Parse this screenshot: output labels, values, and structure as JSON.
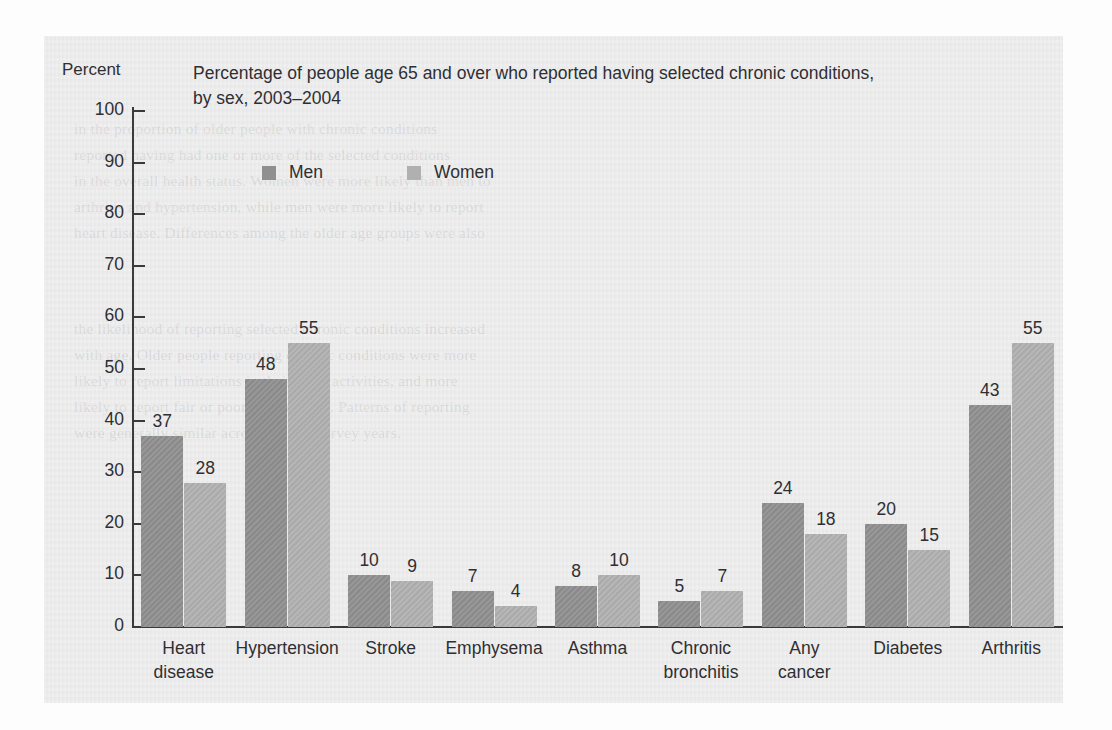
{
  "figure": {
    "background_color": "#fdfdfd",
    "panel_color": "#eeeeee",
    "y_axis_title": "Percent",
    "title_line_1": "Percentage of people age 65 and over who reported having selected chronic conditions,",
    "title_line_2": "by sex, 2003–2004"
  },
  "legend": {
    "items": [
      {
        "label": "Men",
        "color": "#8f8f8f",
        "swatch_name": "legend-swatch-men"
      },
      {
        "label": "Women",
        "color": "#b0b0b0",
        "swatch_name": "legend-swatch-women"
      }
    ]
  },
  "y_axis": {
    "ticks": [
      "100",
      "90",
      "80",
      "70",
      "60",
      "50",
      "40",
      "30",
      "20",
      "10",
      "0"
    ]
  },
  "categories": [
    {
      "line1": "Heart",
      "line2": "disease"
    },
    {
      "line1": "Hypertension",
      "line2": ""
    },
    {
      "line1": "Stroke",
      "line2": ""
    },
    {
      "line1": "Emphysema",
      "line2": ""
    },
    {
      "line1": "Asthma",
      "line2": ""
    },
    {
      "line1": "Chronic",
      "line2": "bronchitis"
    },
    {
      "line1": "Any",
      "line2": "cancer"
    },
    {
      "line1": "Diabetes",
      "line2": ""
    },
    {
      "line1": "Arthritis",
      "line2": ""
    }
  ],
  "values": {
    "men": [
      "37",
      "48",
      "10",
      "7",
      "8",
      "5",
      "24",
      "20",
      "43"
    ],
    "women": [
      "28",
      "55",
      "9",
      "4",
      "10",
      "7",
      "18",
      "15",
      "55"
    ]
  },
  "chart_data": {
    "type": "bar",
    "title": "Percentage of people age 65 and over who reported having selected chronic conditions, by sex, 2003–2004",
    "xlabel": "",
    "ylabel": "Percent",
    "ylim": [
      0,
      100
    ],
    "yticks": [
      0,
      10,
      20,
      30,
      40,
      50,
      60,
      70,
      80,
      90,
      100
    ],
    "grid": false,
    "legend_position": "top-left-inside",
    "value_labels": true,
    "categories": [
      "Heart disease",
      "Hypertension",
      "Stroke",
      "Emphysema",
      "Asthma",
      "Chronic bronchitis",
      "Any cancer",
      "Diabetes",
      "Arthritis"
    ],
    "series": [
      {
        "name": "Men",
        "color": "#8f8f8f",
        "values": [
          37,
          48,
          10,
          7,
          8,
          5,
          24,
          20,
          43
        ]
      },
      {
        "name": "Women",
        "color": "#b0b0b0",
        "values": [
          28,
          55,
          9,
          4,
          10,
          7,
          18,
          15,
          55
        ]
      }
    ]
  },
  "bleed_text": [
    "in the proportion of older people with chronic conditions",
    "reported having had one or more of the selected conditions",
    "in the overall health status. Women were more likely than men to",
    "arthritis and hypertension, while men were more likely to report",
    "heart disease. Differences among the older age groups were also",
    "the likelihood of reporting selected chronic conditions increased",
    "with age. Older people reporting chronic conditions were more",
    "likely to report limitations in their daily activities, and more",
    "likely to report fair or poor health status. Patterns of reporting",
    "were generally similar across the two survey years."
  ]
}
